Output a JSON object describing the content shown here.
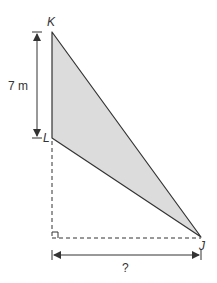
{
  "diagram": {
    "type": "right-triangle-geometry",
    "points": {
      "K": {
        "label": "K"
      },
      "L": {
        "label": "L"
      },
      "J": {
        "label": "J"
      }
    },
    "measurements": {
      "KL_length": "7 m",
      "horizontal_distance": "?"
    },
    "colors": {
      "fill": "#dcdcdc",
      "stroke": "#333333",
      "background": "#ffffff"
    }
  }
}
